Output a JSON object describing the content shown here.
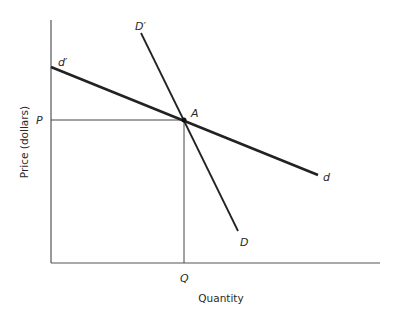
{
  "diagram": {
    "title": "",
    "axes": {
      "x_label": "Quantity",
      "y_label": "Price (dollars)"
    },
    "curves": [
      {
        "name": "d",
        "start_label": "d′",
        "end_label": "d",
        "description": "flatter demand curve"
      },
      {
        "name": "D",
        "start_label": "D′",
        "end_label": "D",
        "description": "steeper demand curve"
      }
    ],
    "point": {
      "label": "A"
    },
    "guides": {
      "price_label": "P",
      "quantity_label": "Q"
    },
    "colors": {
      "line": "#222222",
      "axis": "#555555"
    }
  }
}
